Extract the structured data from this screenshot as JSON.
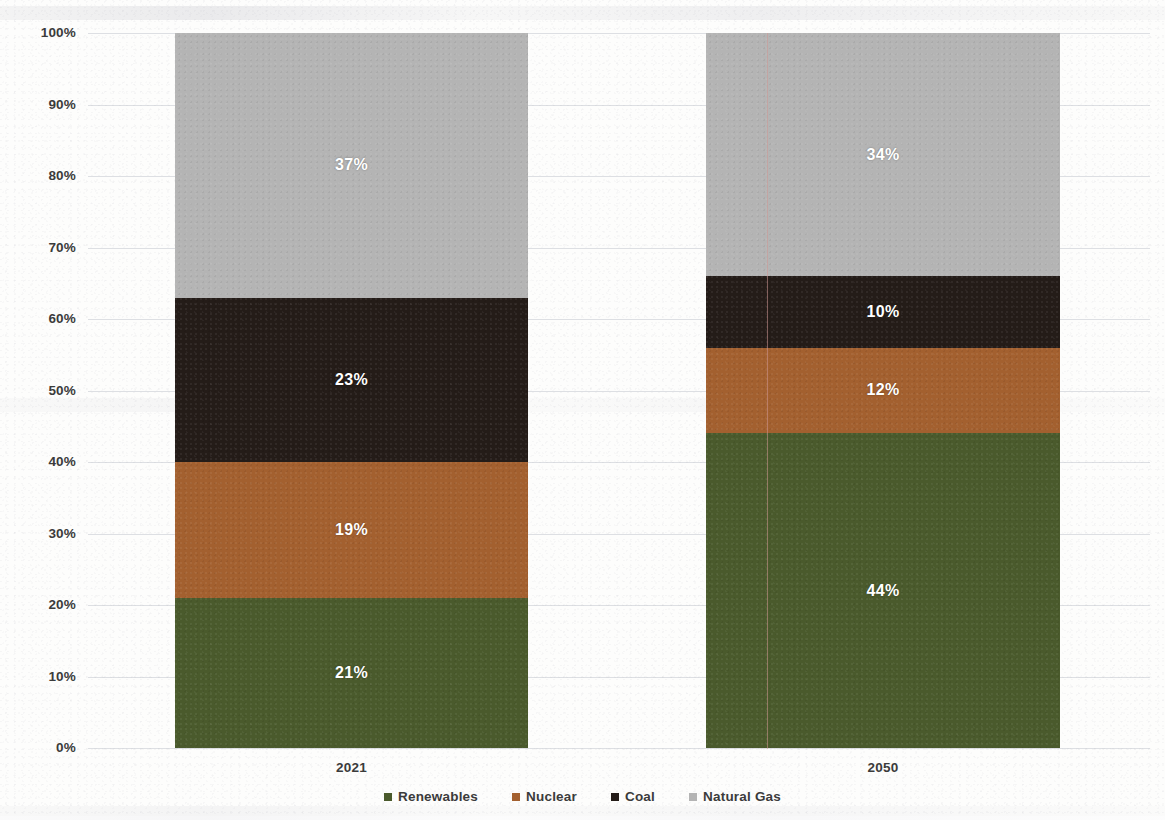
{
  "chart_data": {
    "type": "bar",
    "subtype": "stacked-100-percent",
    "title": "",
    "subtitle": "",
    "xlabel": "",
    "ylabel": "",
    "categories": [
      "2021",
      "2050"
    ],
    "ylim": [
      0,
      100
    ],
    "y_tick_labels": [
      "0%",
      "10%",
      "20%",
      "30%",
      "40%",
      "50%",
      "60%",
      "70%",
      "80%",
      "90%",
      "100%"
    ],
    "y_tick_values": [
      0,
      10,
      20,
      30,
      40,
      50,
      60,
      70,
      80,
      90,
      100
    ],
    "grid": true,
    "legend_position": "bottom",
    "stack_order_bottom_to_top": [
      "Renewables",
      "Nuclear",
      "Coal",
      "Natural Gas"
    ],
    "series": [
      {
        "name": "Renewables",
        "color": "#4a5a2c",
        "values": [
          21,
          44
        ],
        "labels": [
          "21%",
          "44%"
        ]
      },
      {
        "name": "Nuclear",
        "color": "#a3602f",
        "values": [
          19,
          12
        ],
        "labels": [
          "19%",
          "12%"
        ]
      },
      {
        "name": "Coal",
        "color": "#241c18",
        "values": [
          23,
          10
        ],
        "labels": [
          "23%",
          "10%"
        ]
      },
      {
        "name": "Natural Gas",
        "color": "#b4b4b4",
        "values": [
          37,
          34
        ],
        "labels": [
          "37%",
          "34%"
        ]
      }
    ],
    "data_label_color": "#ffffff"
  },
  "axis": {
    "ticks": [
      {
        "label": "100%",
        "value": 100
      },
      {
        "label": "90%",
        "value": 90
      },
      {
        "label": "80%",
        "value": 80
      },
      {
        "label": "70%",
        "value": 70
      },
      {
        "label": "60%",
        "value": 60
      },
      {
        "label": "50%",
        "value": 50
      },
      {
        "label": "40%",
        "value": 40
      },
      {
        "label": "30%",
        "value": 30
      },
      {
        "label": "20%",
        "value": 20
      },
      {
        "label": "10%",
        "value": 10
      },
      {
        "label": "0%",
        "value": 0
      }
    ]
  },
  "categories": [
    {
      "label": "2021"
    },
    {
      "label": "2050"
    }
  ],
  "legend": {
    "items": [
      {
        "label": "Renewables",
        "color": "#4a5a2c"
      },
      {
        "label": "Nuclear",
        "color": "#a3602f"
      },
      {
        "label": "Coal",
        "color": "#241c18"
      },
      {
        "label": "Natural Gas",
        "color": "#b4b4b4"
      }
    ]
  }
}
